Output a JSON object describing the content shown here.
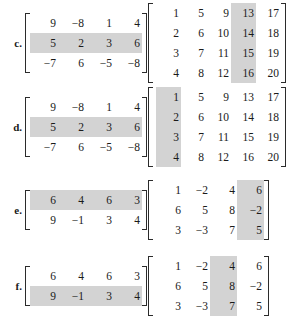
{
  "page": {
    "background": "#ffffff",
    "text_color": "#1a1a1a",
    "shade_color": "#d3d3d3"
  },
  "problems": [
    {
      "label": "c.",
      "left_matrix": {
        "rows": 3,
        "cols": 4,
        "values": [
          [
            "9",
            "−8",
            "1",
            "4"
          ],
          [
            "5",
            "2",
            "3",
            "6"
          ],
          [
            "−7",
            "6",
            "−5",
            "−8"
          ]
        ],
        "shaded_row": 2,
        "shaded_col": null
      },
      "right_matrix": {
        "rows": 4,
        "cols": 5,
        "values": [
          [
            "1",
            "5",
            "9",
            "13",
            "17"
          ],
          [
            "2",
            "6",
            "10",
            "14",
            "18"
          ],
          [
            "3",
            "7",
            "11",
            "15",
            "19"
          ],
          [
            "4",
            "8",
            "12",
            "16",
            "20"
          ]
        ],
        "shaded_row": null,
        "shaded_col": 4
      }
    },
    {
      "label": "d.",
      "left_matrix": {
        "rows": 3,
        "cols": 4,
        "values": [
          [
            "9",
            "−8",
            "1",
            "4"
          ],
          [
            "5",
            "2",
            "3",
            "6"
          ],
          [
            "−7",
            "6",
            "−5",
            "−8"
          ]
        ],
        "shaded_row": 2,
        "shaded_col": null
      },
      "right_matrix": {
        "rows": 4,
        "cols": 5,
        "values": [
          [
            "1",
            "5",
            "9",
            "13",
            "17"
          ],
          [
            "2",
            "6",
            "10",
            "14",
            "18"
          ],
          [
            "3",
            "7",
            "11",
            "15",
            "19"
          ],
          [
            "4",
            "8",
            "12",
            "16",
            "20"
          ]
        ],
        "shaded_row": null,
        "shaded_col": 1
      }
    },
    {
      "label": "e.",
      "left_matrix": {
        "rows": 2,
        "cols": 4,
        "values": [
          [
            "6",
            "4",
            "6",
            "3"
          ],
          [
            "9",
            "−1",
            "3",
            "4"
          ]
        ],
        "shaded_row": 1,
        "shaded_col": null
      },
      "right_matrix": {
        "rows": 3,
        "cols": 4,
        "values": [
          [
            "1",
            "−2",
            "4",
            "6"
          ],
          [
            "6",
            "5",
            "8",
            "−2"
          ],
          [
            "3",
            "−3",
            "7",
            "5"
          ]
        ],
        "shaded_row": null,
        "shaded_col": 4
      }
    },
    {
      "label": "f.",
      "left_matrix": {
        "rows": 2,
        "cols": 4,
        "values": [
          [
            "6",
            "4",
            "6",
            "3"
          ],
          [
            "9",
            "−1",
            "3",
            "4"
          ]
        ],
        "shaded_row": 2,
        "shaded_col": null
      },
      "right_matrix": {
        "rows": 3,
        "cols": 4,
        "values": [
          [
            "1",
            "−2",
            "4",
            "6"
          ],
          [
            "6",
            "5",
            "8",
            "−2"
          ],
          [
            "3",
            "−3",
            "7",
            "5"
          ]
        ],
        "shaded_row": null,
        "shaded_col": 3
      }
    }
  ]
}
